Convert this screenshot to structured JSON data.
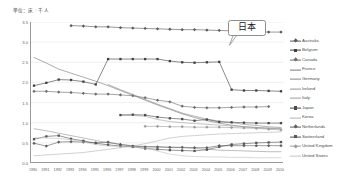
{
  "unit_label": "単位：床／千人",
  "callout": {
    "text": "日本",
    "name": "japan-callout"
  },
  "chart_data": {
    "type": "line",
    "title": "",
    "subtitle": "",
    "xlabel": "",
    "ylabel": "単位：床／千人",
    "grid": true,
    "legend_position": "right",
    "ylim": [
      0.0,
      3.5
    ],
    "yticks": [
      "0.0",
      "0.5",
      "1.0",
      "1.5",
      "2.0",
      "2.5",
      "3.0",
      "3.5"
    ],
    "ytick_values": [
      0.0,
      0.5,
      1.0,
      1.5,
      2.0,
      2.5,
      3.0,
      3.5
    ],
    "x": [
      1990,
      1991,
      1992,
      1993,
      1994,
      1995,
      1996,
      1997,
      1998,
      1999,
      2000,
      2001,
      2002,
      2003,
      2004,
      2005,
      2006,
      2007,
      2008,
      2009,
      2010
    ],
    "categories": [
      "1990",
      "1991",
      "1992",
      "1993",
      "1994",
      "1995",
      "1996",
      "1997",
      "1998",
      "1999",
      "2000",
      "2001",
      "2002",
      "2003",
      "2004",
      "2005",
      "2006",
      "2007",
      "2008",
      "2009",
      "2010"
    ],
    "series": [
      {
        "name": "Australia",
        "color": "#5a5a5a",
        "marker": "diamond",
        "values": [
          null,
          null,
          null,
          3.41,
          3.4,
          3.38,
          3.38,
          3.36,
          3.35,
          3.34,
          3.33,
          3.32,
          3.31,
          3.31,
          3.3,
          3.29,
          3.28,
          3.27,
          3.26,
          3.25,
          3.25
        ]
      },
      {
        "name": "Belgium",
        "color": "#3f3f3f",
        "marker": "square",
        "values": [
          1.92,
          1.99,
          2.07,
          2.06,
          2.02,
          1.95,
          2.58,
          2.58,
          2.58,
          2.58,
          2.58,
          2.53,
          2.5,
          2.49,
          2.5,
          2.51,
          1.82,
          1.8,
          1.8,
          1.79,
          1.78
        ]
      },
      {
        "name": "Canada",
        "color": "#6e6e6e",
        "marker": "diamond",
        "values": [
          1.78,
          1.78,
          1.76,
          1.75,
          1.73,
          1.71,
          1.71,
          1.69,
          1.67,
          1.62,
          1.56,
          1.52,
          1.41,
          1.38,
          1.37,
          1.37,
          1.38,
          1.39,
          1.39,
          1.4,
          null
        ]
      },
      {
        "name": "France",
        "color": "#7a7a7a",
        "marker": "none",
        "values": [
          2.62,
          2.48,
          2.33,
          2.23,
          2.13,
          2.03,
          1.92,
          1.8,
          1.68,
          1.56,
          1.44,
          1.33,
          1.22,
          1.13,
          1.05,
          0.99,
          0.94,
          0.9,
          0.88,
          0.86,
          0.85
        ]
      },
      {
        "name": "Germany",
        "color": "#888888",
        "marker": "none",
        "values": [
          null,
          null,
          null,
          null,
          null,
          null,
          1.95,
          1.82,
          1.7,
          1.58,
          1.46,
          1.35,
          1.24,
          1.16,
          1.09,
          1.04,
          1.0,
          0.96,
          0.93,
          0.9,
          0.88
        ]
      },
      {
        "name": "Ireland",
        "color": "#959595",
        "marker": "none",
        "values": [
          0.85,
          0.8,
          0.74,
          0.68,
          0.62,
          0.56,
          0.5,
          0.46,
          0.43,
          0.41,
          0.4,
          0.39,
          0.38,
          0.36,
          0.34,
          0.32,
          0.31,
          0.3,
          0.29,
          0.28,
          0.28
        ]
      },
      {
        "name": "Italy",
        "color": "#a0a0a0",
        "marker": "none",
        "values": [
          null,
          null,
          null,
          null,
          null,
          null,
          null,
          1.19,
          1.18,
          1.16,
          1.08,
          1.03,
          1.0,
          0.98,
          0.96,
          0.94,
          0.92,
          0.9,
          0.88,
          0.87,
          0.86
        ]
      },
      {
        "name": "Japan",
        "color": "#4a4a4a",
        "marker": "square",
        "values": [
          null,
          null,
          null,
          null,
          null,
          null,
          null,
          1.19,
          1.2,
          1.19,
          1.14,
          1.11,
          1.09,
          1.05,
          1.08,
          1.02,
          1.01,
          1.0,
          0.99,
          0.99,
          0.99
        ]
      },
      {
        "name": "Korea",
        "color": "#b4b4b4",
        "marker": "none",
        "values": [
          0.18,
          0.2,
          0.22,
          0.24,
          0.26,
          0.3,
          0.34,
          0.38,
          0.42,
          0.48,
          0.55,
          0.62,
          0.66,
          0.68,
          0.7,
          0.72,
          0.73,
          0.74,
          0.75,
          0.76,
          0.77
        ]
      },
      {
        "name": "Netherlands",
        "color": "#5f5f5f",
        "marker": "diamond",
        "values": [
          0.49,
          0.42,
          0.52,
          0.53,
          0.52,
          0.5,
          0.52,
          0.46,
          0.42,
          0.4,
          0.4,
          0.39,
          0.39,
          0.38,
          0.38,
          0.43,
          0.43,
          0.43,
          0.43,
          0.43,
          0.43
        ]
      },
      {
        "name": "Switzerland",
        "color": "#555555",
        "marker": "square",
        "values": [
          0.59,
          0.66,
          0.68,
          0.6,
          0.55,
          0.49,
          0.45,
          0.42,
          0.4,
          0.36,
          0.34,
          0.32,
          0.31,
          0.3,
          0.33,
          0.4,
          0.46,
          0.48,
          0.5,
          0.51,
          0.52
        ]
      },
      {
        "name": "United Kingdom",
        "color": "#9d9d9d",
        "marker": "diamond",
        "values": [
          null,
          null,
          null,
          null,
          null,
          null,
          null,
          null,
          null,
          0.91,
          0.91,
          0.9,
          0.9,
          0.89,
          0.89,
          0.89,
          0.88,
          0.87,
          0.86,
          0.84,
          0.82
        ]
      },
      {
        "name": "United States",
        "color": "#c2c2c2",
        "marker": "none",
        "values": [
          0.63,
          0.62,
          0.61,
          0.58,
          0.52,
          0.46,
          0.42,
          0.41,
          0.4,
          0.37,
          0.3,
          0.22,
          0.18,
          0.16,
          0.15,
          0.15,
          0.14,
          0.14,
          0.13,
          0.13,
          0.13
        ]
      }
    ]
  }
}
